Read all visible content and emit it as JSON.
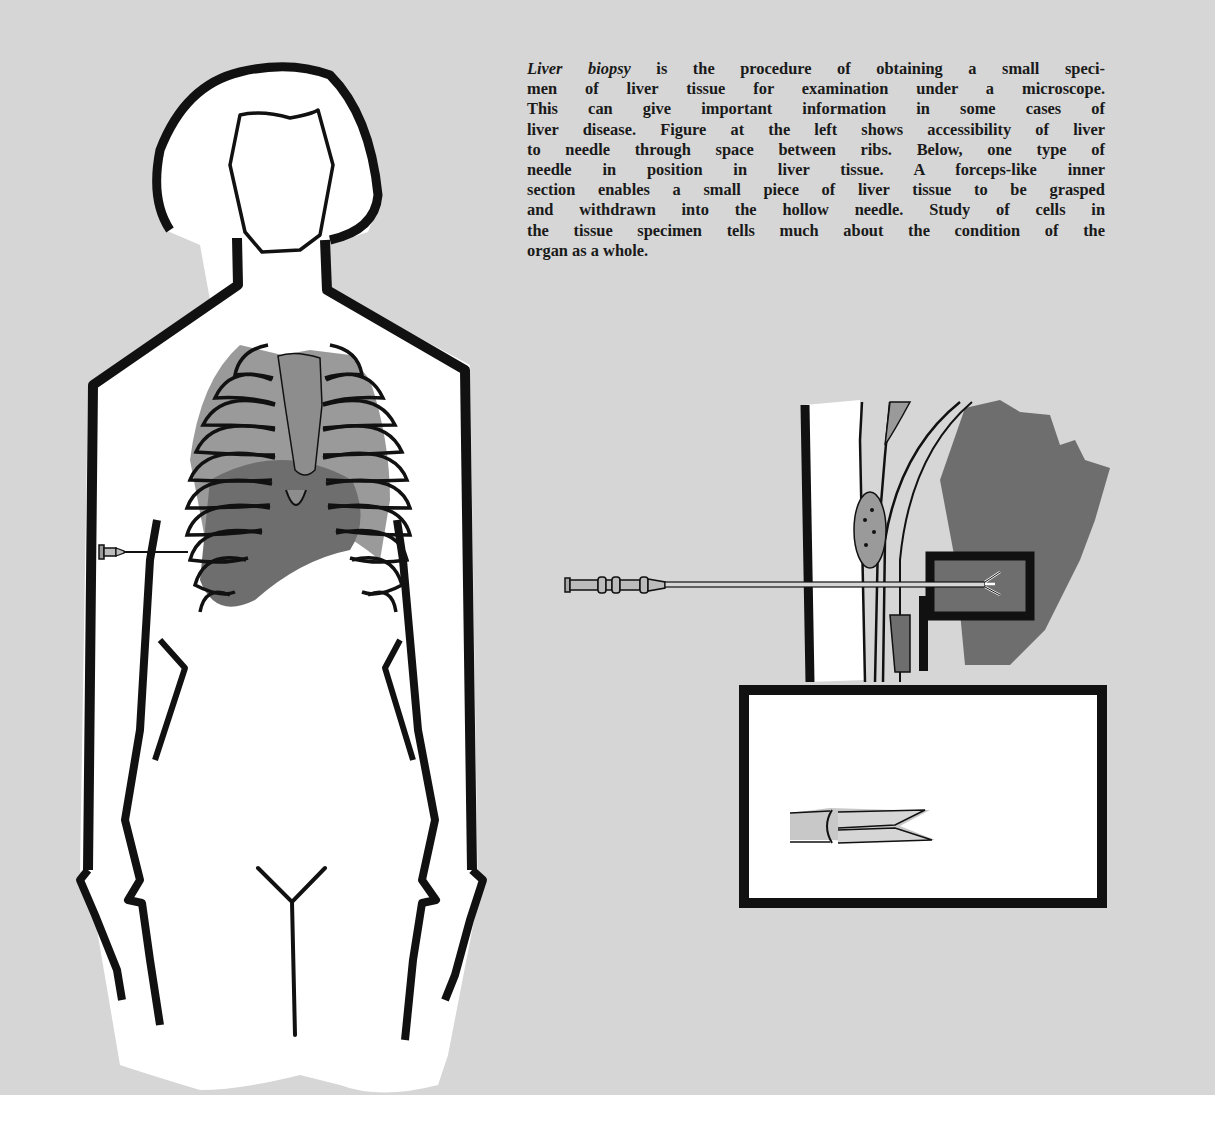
{
  "caption": {
    "term": "Liver biopsy",
    "lines": [
      " is the procedure of obtaining a small speci-",
      "men of liver tissue for examination under a microscope.",
      "This can give important information in some cases of",
      "liver disease. Figure at the left shows accessibility of liver",
      "to needle through space between ribs. Below, one type of",
      "needle in position in liver tissue. A forceps-like inner",
      "section enables a small piece of liver tissue to be grasped",
      "and withdrawn into the hollow needle. Study of cells in",
      "the tissue specimen tells much about the condition of the",
      "organ as a whole."
    ]
  },
  "figures": {
    "body": "female torso outline showing rib cage, liver and biopsy needle inserted between ribs",
    "detail": "biopsy needle penetrating chest wall into liver tissue",
    "inset": "magnified view of forceps-like needle tip"
  },
  "colors": {
    "background": "#d6d6d6",
    "outline": "#111111",
    "rib_fill": "#9a9a9a",
    "liver_fill": "#6e6e6e",
    "paper": "#ffffff"
  }
}
